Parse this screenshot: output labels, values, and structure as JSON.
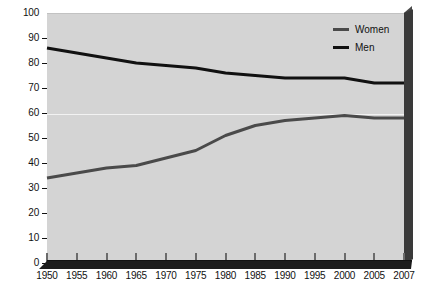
{
  "chart_data": {
    "type": "line",
    "title": "",
    "subtitle": "",
    "xlabel": "",
    "ylabel": "",
    "x": [
      1950,
      1955,
      1960,
      1965,
      1970,
      1975,
      1980,
      1985,
      1990,
      1995,
      2000,
      2005,
      2007
    ],
    "categories": [
      "1950",
      "1955",
      "1960",
      "1965",
      "1970",
      "1975",
      "1980",
      "1985",
      "1990",
      "1995",
      "2000",
      "2005",
      "2007"
    ],
    "series": [
      {
        "name": "Women",
        "color": "#4a4a4a",
        "values": [
          34,
          36,
          38,
          39,
          42,
          45,
          51,
          55,
          57,
          58,
          59,
          58,
          58
        ]
      },
      {
        "name": "Men",
        "color": "#111111",
        "values": [
          86,
          84,
          82,
          80,
          79,
          78,
          76,
          75,
          74,
          74,
          74,
          72,
          72
        ]
      }
    ],
    "ylim": [
      0,
      100
    ],
    "ytick_values": [
      0,
      10,
      20,
      30,
      40,
      50,
      60,
      70,
      80,
      90,
      100
    ],
    "yticks": [
      "0",
      "10",
      "20",
      "30",
      "40",
      "50",
      "60",
      "70",
      "80",
      "90",
      "100"
    ],
    "xlim": [
      1950,
      2007
    ],
    "grid": "single-horizontal-at-60",
    "legend_position": "top-right",
    "plot_background": "#d4d4d4",
    "page_background": "#ffffff"
  },
  "legend": {
    "items": [
      {
        "label": "Women",
        "color": "#4a4a4a"
      },
      {
        "label": "Men",
        "color": "#111111"
      }
    ]
  }
}
